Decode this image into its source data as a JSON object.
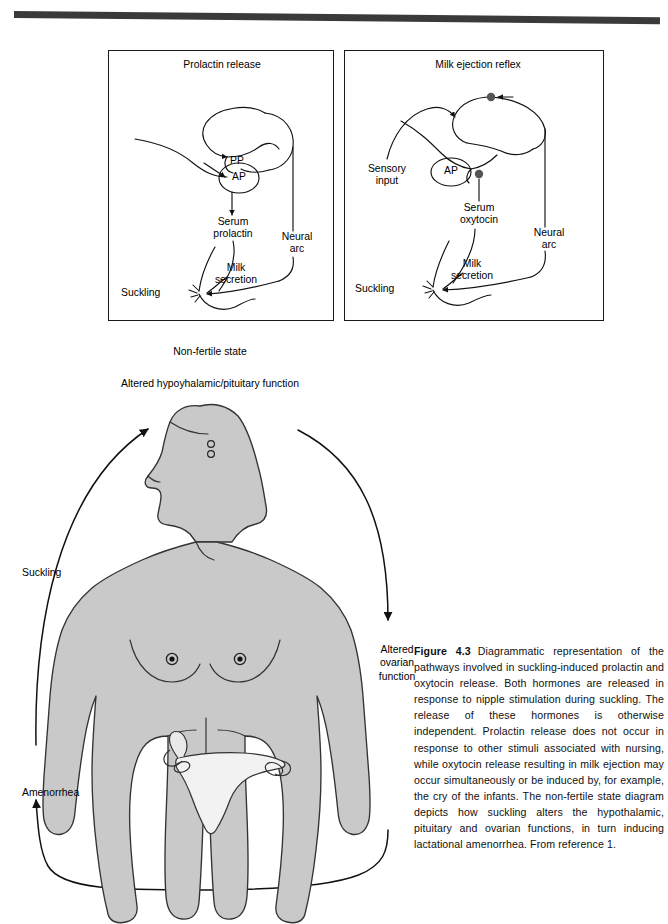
{
  "figure": {
    "number": "Figure 4.3",
    "caption": "Diagrammatic representation of the pathways involved in suckling-induced prolactin and oxytocin release. Both hormones are released in response to nipple stimulation during suckling. The release of these hormones is otherwise independent. Prolactin release does not occur in response to other stimuli associated with nursing, while oxytocin release resulting in milk ejection may occur simultaneously or be induced by, for example, the cry of the infants. The non-fertile state diagram depicts how suckling alters the hypothalamic, pituitary and ovarian functions, in turn inducing lactational amenorrhea. From reference 1."
  },
  "panels": [
    {
      "id": "prolactin",
      "title": "Prolactin release",
      "labels": {
        "pp": "PP",
        "ap": "AP",
        "hormone": "Serum\nprolactin",
        "neural_arc": "Neural\narc",
        "milk": "Milk\nsecretion",
        "suckling": "Suckling"
      }
    },
    {
      "id": "milk-ejection",
      "title": "Milk ejection reflex",
      "labels": {
        "sensory": "Sensory\ninput",
        "ap": "AP",
        "hormone": "Serum\noxytocin",
        "neural_arc": "Neural\narc",
        "milk": "Milk\nsecretion",
        "suckling": "Suckling"
      }
    }
  ],
  "non_fertile": {
    "title": "Non-fertile state",
    "subtitle": "Altered hypoyhalamic/pituitary function",
    "left_label": "Suckling",
    "right_label": "Altered\novarian\nfunction",
    "bottom_label": "Amenorrhea"
  },
  "colors": {
    "body_fill": "#c9c9c9",
    "outline": "#1a1a1a",
    "rule": "#3a3a3a",
    "node": "#555555"
  }
}
